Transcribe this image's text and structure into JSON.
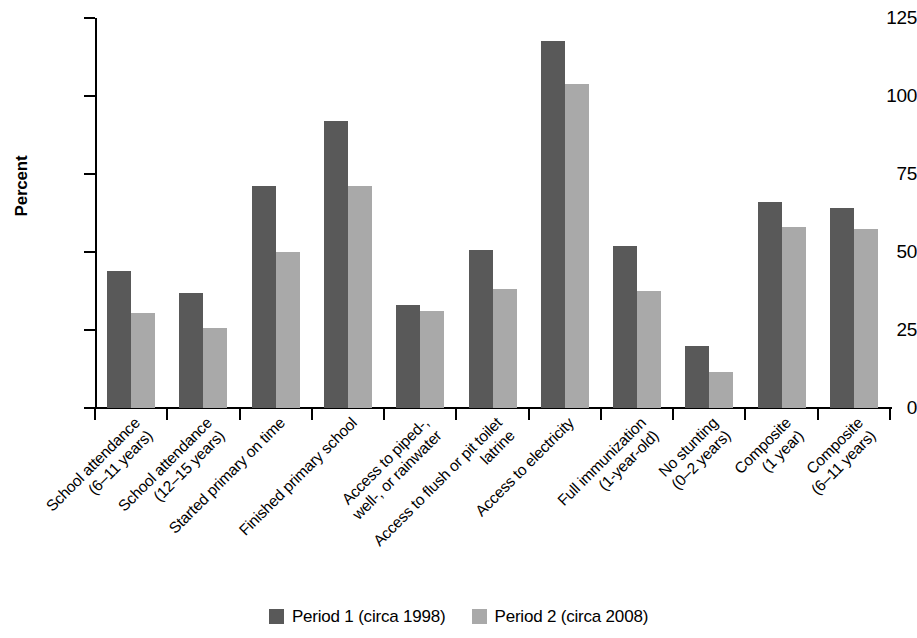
{
  "chart_data": {
    "type": "bar",
    "title": "",
    "subtitle": "",
    "xlabel": "",
    "ylabel": "Percent",
    "ylim": [
      0,
      125
    ],
    "yticks": [
      0,
      25,
      50,
      75,
      100,
      125
    ],
    "ytick_labels": [
      "0",
      "25",
      "50",
      "75",
      "100",
      "125"
    ],
    "grid": false,
    "legend_position": "bottom-center",
    "categories": [
      "School attendance\n(6–11 years)",
      "School attendance\n(12–15 years)",
      "Started primary on time",
      "Finished primary school",
      "Access to piped-,\nwell-, or rainwater",
      "Access to flush or pit toilet\nlatrine",
      "Access to electricity",
      "Full immunization\n(1-year-old)",
      "No stunting\n(0–2 years)",
      "Composite\n(1 year)",
      "Composite\n(6–11 years)"
    ],
    "series": [
      {
        "name": "Period 1 (circa 1998)",
        "color": "#595959",
        "values": [
          44,
          37,
          71,
          92,
          33,
          50.5,
          117.5,
          52,
          20,
          66,
          64
        ]
      },
      {
        "name": "Period 2 (circa 2008)",
        "color": "#a9a9a9",
        "values": [
          30.5,
          25.5,
          50,
          71,
          31,
          38,
          104,
          37.5,
          11.5,
          58,
          57.5
        ]
      }
    ]
  },
  "legend": {
    "items": [
      {
        "label": "Period 1 (circa 1998)",
        "color": "#595959"
      },
      {
        "label": "Period 2 (circa 2008)",
        "color": "#a9a9a9"
      }
    ]
  }
}
